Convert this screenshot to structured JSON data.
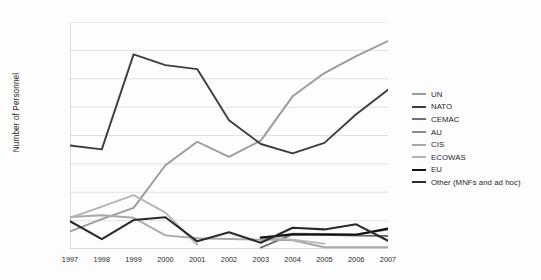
{
  "chart_data": {
    "type": "line",
    "title": "",
    "xlabel": "",
    "ylabel": "Number of Personnel",
    "categories": [
      "1997",
      "1998",
      "1999",
      "2000",
      "2001",
      "2002",
      "2003",
      "2004",
      "2005",
      "2006",
      "2007"
    ],
    "x": [
      1997,
      1998,
      1999,
      2000,
      2001,
      2002,
      2003,
      2004,
      2005,
      2006,
      2007
    ],
    "ylim": [
      0,
      80000
    ],
    "xlim": [
      1997,
      2007
    ],
    "yticks": [
      "10,000",
      "20,000",
      "30,000",
      "40,000",
      "50,000",
      "60,000",
      "70,000",
      "80,000"
    ],
    "ytick_values": [
      10000,
      20000,
      30000,
      40000,
      50000,
      60000,
      70000,
      80000
    ],
    "grid": "horizontal",
    "legend_position": "right",
    "series": [
      {
        "name": "UN",
        "color": "#9a9a9a",
        "width": 1.9,
        "values": [
          6200,
          10500,
          14500,
          29500,
          37800,
          32500,
          38200,
          53800,
          62000,
          68000,
          73300
        ]
      },
      {
        "name": "NATO",
        "color": "#3d3d3d",
        "width": 1.9,
        "values": [
          36500,
          35100,
          68600,
          64800,
          63400,
          45400,
          37000,
          33700,
          37400,
          47500,
          56100
        ]
      },
      {
        "name": "CEMAC",
        "color": "#6f6f6f",
        "width": 1.9,
        "values": [
          null,
          null,
          null,
          null,
          null,
          null,
          500,
          5200,
          5000,
          4700,
          4600
        ]
      },
      {
        "name": "AU",
        "color": "#8a8a8a",
        "width": 1.9,
        "values": [
          null,
          null,
          null,
          null,
          null,
          null,
          3200,
          5400,
          5300,
          5100,
          6900
        ]
      },
      {
        "name": "CIS",
        "color": "#a8a8a8",
        "width": 1.9,
        "values": [
          11300,
          11900,
          11000,
          4800,
          3800,
          3500,
          3300,
          3100,
          600,
          600,
          600
        ]
      },
      {
        "name": "ECOWAS",
        "color": "#b5b5b5",
        "width": 1.9,
        "values": [
          11000,
          14900,
          19000,
          12800,
          1500,
          null,
          4200,
          3300,
          1900,
          null,
          null
        ]
      },
      {
        "name": "EU",
        "color": "#111111",
        "width": 2.1,
        "values": [
          null,
          null,
          null,
          null,
          null,
          null,
          4000,
          5200,
          5100,
          5000,
          7200
        ]
      },
      {
        "name": "Other (MNFs and ad hoc)",
        "color": "#2a2a2a",
        "width": 2.1,
        "values": [
          9800,
          3500,
          10200,
          11200,
          2700,
          5900,
          2200,
          7500,
          6900,
          8700,
          2900
        ]
      }
    ]
  },
  "legend": {
    "items": [
      {
        "label": "UN"
      },
      {
        "label": "NATO"
      },
      {
        "label": "CEMAC"
      },
      {
        "label": "AU"
      },
      {
        "label": "CIS"
      },
      {
        "label": "ECOWAS"
      },
      {
        "label": "EU"
      },
      {
        "label": "Other (MNFs and ad hoc)"
      }
    ]
  },
  "axes": {
    "y_title": "Number of Personnel",
    "axis_color": "#b9b9b9",
    "grid_color": "#d9d9d9"
  }
}
